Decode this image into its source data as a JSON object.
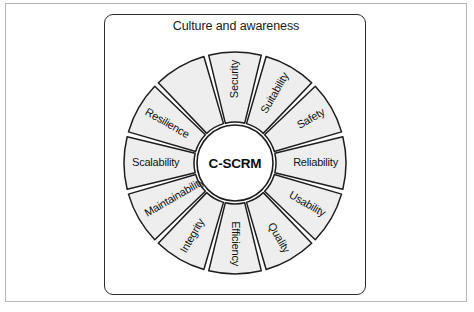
{
  "diagram": {
    "panel_title": "Culture and awareness",
    "hub_label": "C-SCRM",
    "segment_fill": "#eeeeee",
    "segment_stroke": "#1d1d1d",
    "panel_border_color": "#2b2b2b",
    "outer_frame_color": "#b9b9b9",
    "background": "#ffffff",
    "segment_count": 12,
    "segments": [
      {
        "label": "Security",
        "index": 0
      },
      {
        "label": "Suitability",
        "index": 1
      },
      {
        "label": "Safety",
        "index": 2
      },
      {
        "label": "Reliability",
        "index": 3
      },
      {
        "label": "Usability",
        "index": 4
      },
      {
        "label": "Quality",
        "index": 5
      },
      {
        "label": "Efficiency",
        "index": 6
      },
      {
        "label": "Integrity",
        "index": 7
      },
      {
        "label": "Maintainability",
        "index": 8
      },
      {
        "label": "Scalability",
        "index": 9
      },
      {
        "label": "Resilience",
        "index": 10
      },
      {
        "label": "Security",
        "index": 11
      }
    ],
    "wheel_labels_clockwise_from_top": [
      "Security",
      "Suitability",
      "Safety",
      "Reliability",
      "Usability",
      "Quality",
      "Efficiency",
      "Integrity",
      "Maintainability",
      "Scalability",
      "Resilience"
    ]
  }
}
